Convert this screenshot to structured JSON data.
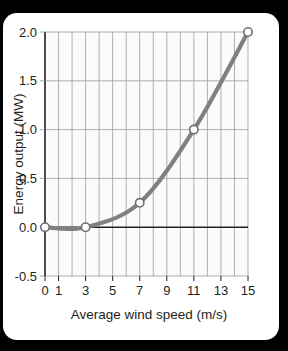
{
  "figure": {
    "background_color": "#000000",
    "card_color": "#ffffff"
  },
  "chart_data": {
    "type": "line",
    "title": "",
    "xlabel": "Average wind speed (m/s)",
    "ylabel": "Energy output (MW)",
    "xlim": [
      0,
      15
    ],
    "ylim": [
      -0.5,
      2.0
    ],
    "x": [
      0,
      3,
      7,
      11,
      15
    ],
    "values": [
      0.0,
      0.0,
      0.25,
      1.0,
      2.0
    ],
    "series": [
      {
        "name": "Energy output",
        "x": [
          0,
          3,
          7,
          11,
          15
        ],
        "values": [
          0.0,
          0.0,
          0.25,
          1.0,
          2.0
        ],
        "line_color": "#808080",
        "marker_face_color": "#ffffff",
        "marker_edge_color": "#6e6e6e"
      }
    ],
    "xtick_labels": [
      "0",
      "1",
      "3",
      "5",
      "7",
      "9",
      "11",
      "13",
      "15"
    ],
    "xtick_values": [
      0,
      1,
      3,
      5,
      7,
      9,
      11,
      13,
      15
    ],
    "ytick_labels": [
      "2.0",
      "1.5",
      "1.0",
      "0.5",
      "0.0",
      "-0.5"
    ],
    "ytick_values": [
      2.0,
      1.5,
      1.0,
      0.5,
      0.0,
      -0.5
    ],
    "x_gridline_values": [
      1,
      2,
      3,
      4,
      5,
      6,
      7,
      8,
      9,
      10,
      11,
      12,
      13,
      14,
      15
    ],
    "y_gridline_values": [
      2.0,
      1.5,
      1.0,
      0.5,
      -0.5
    ],
    "grid": true,
    "legend": "none",
    "zero_line": 0.0,
    "grid_color": "#9a9a9a",
    "axis_color": "#231f20",
    "plot_bg_color": "#fbfbfb"
  }
}
